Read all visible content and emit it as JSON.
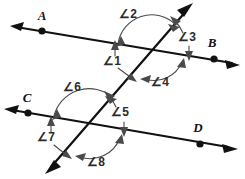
{
  "figure": {
    "kind": "geometry-diagram",
    "background_color": "#ffffff",
    "line_color": "#111111",
    "arc_color": "#4a4a4a"
  },
  "points": [
    {
      "id": "A",
      "label": "A",
      "x": 42,
      "y": 31,
      "label_x": 42,
      "label_y": 20
    },
    {
      "id": "B",
      "label": "B",
      "x": 214,
      "y": 59,
      "label_x": 212,
      "label_y": 47
    },
    {
      "id": "C",
      "label": "C",
      "x": 28,
      "y": 113,
      "label_x": 27,
      "label_y": 102
    },
    {
      "id": "D",
      "label": "D",
      "x": 200,
      "y": 144,
      "label_x": 198,
      "label_y": 132
    }
  ],
  "lines": [
    {
      "id": "line-AB",
      "name": "upper-parallel-line",
      "from_x": 12,
      "from_y": 27,
      "to_x": 236,
      "to_y": 64,
      "arrows": "both"
    },
    {
      "id": "line-CD",
      "name": "lower-parallel-line",
      "from_x": 6,
      "from_y": 110,
      "to_x": 232,
      "to_y": 148,
      "arrows": "both"
    },
    {
      "id": "line-transversal",
      "name": "transversal-line",
      "from_x": 192,
      "from_y": 4,
      "to_x": 46,
      "to_y": 172,
      "arrows": "both"
    }
  ],
  "intersections": [
    {
      "id": "upper",
      "x": 152,
      "y": 48
    },
    {
      "id": "lower",
      "x": 90,
      "y": 125
    }
  ],
  "angles": [
    {
      "id": "angle-1",
      "label": "∠1",
      "label_x": 112,
      "label_y": 65
    },
    {
      "id": "angle-2",
      "label": "∠2",
      "label_x": 128,
      "label_y": 18
    },
    {
      "id": "angle-3",
      "label": "∠3",
      "label_x": 187,
      "label_y": 41
    },
    {
      "id": "angle-4",
      "label": "∠4",
      "label_x": 160,
      "label_y": 86
    },
    {
      "id": "angle-5",
      "label": "∠5",
      "label_x": 120,
      "label_y": 116
    },
    {
      "id": "angle-6",
      "label": "∠6",
      "label_x": 72,
      "label_y": 91
    },
    {
      "id": "angle-7",
      "label": "∠7",
      "label_x": 46,
      "label_y": 141
    },
    {
      "id": "angle-8",
      "label": "∠8",
      "label_x": 96,
      "label_y": 166
    }
  ]
}
